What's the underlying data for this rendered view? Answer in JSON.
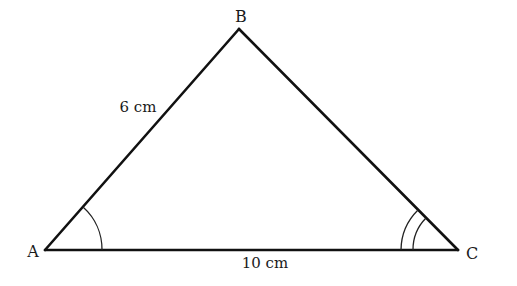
{
  "diagram": {
    "type": "triangle",
    "vertices": {
      "A": {
        "label": "A",
        "x": 45,
        "y": 250
      },
      "B": {
        "label": "B",
        "x": 239,
        "y": 29
      },
      "C": {
        "label": "C",
        "x": 458,
        "y": 250
      }
    },
    "sides": {
      "AB": {
        "label": "6 cm"
      },
      "AC": {
        "label": "10 cm"
      }
    },
    "angle_marks": {
      "A": {
        "arcs": 1
      },
      "C": {
        "arcs": 2
      }
    },
    "colors": {
      "line": "#111111",
      "background": "#ffffff"
    }
  }
}
